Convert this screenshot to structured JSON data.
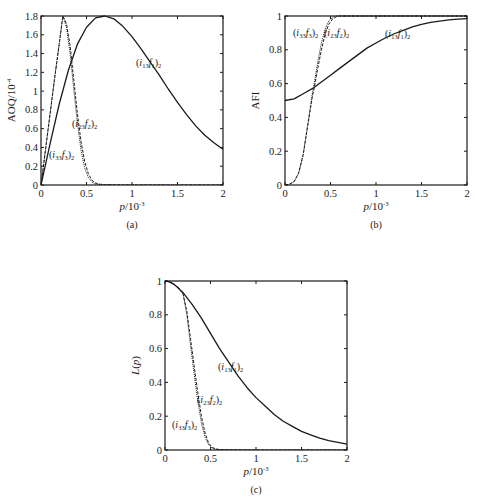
{
  "chart_data": [
    {
      "id": "a",
      "type": "line",
      "caption": "(a)",
      "xlabel": "p/10^-3",
      "xlabel_main": "p",
      "xlabel_unit": "/10",
      "xlabel_exp": "-3",
      "ylabel": "AOQ/10^-4",
      "ylabel_main": "AOQ/10",
      "ylabel_exp": "-4",
      "xlim": [
        0,
        2
      ],
      "ylim": [
        0,
        1.8
      ],
      "xticks": [
        0,
        0.5,
        1,
        1.5,
        2
      ],
      "xtick_labels": [
        "0",
        "0.5",
        "1",
        "1.5",
        "2"
      ],
      "yticks": [
        0,
        0.2,
        0.4,
        0.6,
        0.8,
        1,
        1.2,
        1.4,
        1.6,
        1.8
      ],
      "ytick_labels": [
        "0",
        "0.2",
        "0.4",
        "0.6",
        "0.8",
        "1",
        "1.2",
        "1.4",
        "1.6",
        "1.8"
      ],
      "grid": false,
      "frame": {
        "left": 41,
        "top": 16,
        "right": 223,
        "bottom": 185
      },
      "series": [
        {
          "name": "(i13f1)2",
          "style": "solid",
          "x": [
            0,
            0.05,
            0.1,
            0.2,
            0.3,
            0.4,
            0.5,
            0.6,
            0.7,
            0.8,
            0.9,
            1.0,
            1.1,
            1.2,
            1.3,
            1.4,
            1.5,
            1.6,
            1.7,
            1.8,
            1.9,
            2.0
          ],
          "y": [
            0,
            0.22,
            0.44,
            0.86,
            1.22,
            1.5,
            1.68,
            1.78,
            1.8,
            1.77,
            1.69,
            1.58,
            1.45,
            1.31,
            1.17,
            1.02,
            0.88,
            0.75,
            0.63,
            0.53,
            0.45,
            0.38
          ]
        },
        {
          "name": "(i23f2)2",
          "style": "dashed",
          "x": [
            0,
            0.05,
            0.1,
            0.15,
            0.2,
            0.24,
            0.28,
            0.32,
            0.36,
            0.4,
            0.44,
            0.48,
            0.52,
            0.56,
            0.6,
            0.65,
            0.7,
            0.8,
            1.0,
            1.5,
            2.0
          ],
          "y": [
            0,
            0.38,
            0.76,
            1.14,
            1.5,
            1.8,
            1.72,
            1.48,
            1.12,
            0.76,
            0.46,
            0.25,
            0.12,
            0.05,
            0.02,
            0.008,
            0.004,
            0.001,
            0,
            0,
            0
          ]
        },
        {
          "name": "(i33f3)2",
          "style": "dotted",
          "x": [
            0,
            0.05,
            0.1,
            0.15,
            0.2,
            0.24,
            0.28,
            0.32,
            0.36,
            0.4,
            0.44,
            0.48,
            0.52,
            0.56,
            0.6,
            0.65,
            0.7,
            0.8,
            1.0,
            1.5,
            2.0
          ],
          "y": [
            0,
            0.38,
            0.76,
            1.14,
            1.5,
            1.8,
            1.68,
            1.4,
            1.02,
            0.66,
            0.37,
            0.18,
            0.08,
            0.03,
            0.01,
            0.004,
            0.002,
            0.001,
            0,
            0,
            0
          ]
        }
      ],
      "annotations": [
        {
          "text": "(i13f1)2",
          "base": "(i",
          "sub1": "13",
          "mid": "f",
          "sub2": "1",
          "close": ")",
          "sub3": "2",
          "x": 136,
          "y": 66
        },
        {
          "text": "(i23f2)2",
          "base": "(i",
          "sub1": "23",
          "mid": "f",
          "sub2": "2",
          "close": ")",
          "sub3": "2",
          "x": 72,
          "y": 127
        },
        {
          "text": "(i33f3)2",
          "base": "(i",
          "sub1": "33",
          "mid": "f",
          "sub2": "3",
          "close": ")",
          "sub3": "2",
          "x": 49,
          "y": 158
        }
      ]
    },
    {
      "id": "b",
      "type": "line",
      "caption": "(b)",
      "xlabel": "p/10^-3",
      "xlabel_main": "p",
      "xlabel_unit": "/10",
      "xlabel_exp": "-3",
      "ylabel": "AFI",
      "ylabel_main": "AFI",
      "ylabel_exp": "",
      "xlim": [
        0,
        2
      ],
      "ylim": [
        0,
        1
      ],
      "xticks": [
        0,
        0.5,
        1,
        1.5,
        2
      ],
      "xtick_labels": [
        "0",
        "0.5",
        "1",
        "1.5",
        "2"
      ],
      "yticks": [
        0,
        0.2,
        0.4,
        0.6,
        0.8,
        1
      ],
      "ytick_labels": [
        "0",
        "0.2",
        "0.4",
        "0.6",
        "0.8",
        "1"
      ],
      "grid": false,
      "frame": {
        "left": 285,
        "top": 16,
        "right": 467,
        "bottom": 185
      },
      "series": [
        {
          "name": "(i13f1)2",
          "style": "solid",
          "x": [
            0,
            0.1,
            0.2,
            0.3,
            0.4,
            0.5,
            0.6,
            0.7,
            0.8,
            0.9,
            1.0,
            1.1,
            1.2,
            1.3,
            1.4,
            1.5,
            1.6,
            1.7,
            1.8,
            1.9,
            2.0
          ],
          "y": [
            0.5,
            0.51,
            0.54,
            0.57,
            0.61,
            0.65,
            0.69,
            0.73,
            0.77,
            0.81,
            0.84,
            0.87,
            0.895,
            0.915,
            0.935,
            0.95,
            0.962,
            0.97,
            0.977,
            0.982,
            0.985
          ]
        },
        {
          "name": "(i23f2)2",
          "style": "dashed",
          "x": [
            0,
            0.05,
            0.1,
            0.15,
            0.2,
            0.25,
            0.3,
            0.33,
            0.36,
            0.4,
            0.44,
            0.48,
            0.52,
            0.56,
            0.6,
            0.7,
            1.0,
            2.0
          ],
          "y": [
            0,
            0.005,
            0.02,
            0.07,
            0.18,
            0.35,
            0.52,
            0.6,
            0.69,
            0.8,
            0.89,
            0.95,
            0.98,
            0.995,
            1,
            1,
            1,
            1
          ]
        },
        {
          "name": "(i33f3)2",
          "style": "dotted",
          "x": [
            0,
            0.05,
            0.1,
            0.15,
            0.2,
            0.25,
            0.3,
            0.33,
            0.36,
            0.4,
            0.44,
            0.48,
            0.52,
            0.56,
            0.6,
            0.7,
            1.0,
            2.0
          ],
          "y": [
            0,
            0.005,
            0.02,
            0.07,
            0.18,
            0.36,
            0.54,
            0.63,
            0.73,
            0.84,
            0.92,
            0.97,
            0.99,
            1,
            1,
            1,
            1,
            1
          ]
        }
      ],
      "annotations": [
        {
          "text": "(i33f3)2",
          "base": "(i",
          "sub1": "33",
          "mid": "f",
          "sub2": "3",
          "close": ")",
          "sub3": "2",
          "x": 293,
          "y": 36
        },
        {
          "text": "(i23f2)2",
          "base": "(i",
          "sub1": "23",
          "mid": "f",
          "sub2": "2",
          "close": ")",
          "sub3": "2",
          "x": 324,
          "y": 36
        },
        {
          "text": "(i13f1)2",
          "base": "(i",
          "sub1": "13",
          "mid": "f",
          "sub2": "1",
          "close": ")",
          "sub3": "2",
          "x": 385,
          "y": 37
        }
      ]
    },
    {
      "id": "c",
      "type": "line",
      "caption": "(c)",
      "xlabel": "p/10^-3",
      "xlabel_main": "p",
      "xlabel_unit": "/10",
      "xlabel_exp": "-3",
      "ylabel": "L(p)",
      "ylabel_main": "L(p)",
      "ylabel_exp": "",
      "xlim": [
        0,
        2
      ],
      "ylim": [
        0,
        1
      ],
      "xticks": [
        0,
        0.5,
        1,
        1.5,
        2
      ],
      "xtick_labels": [
        "0",
        "0.5",
        "1",
        "1.5",
        "2"
      ],
      "yticks": [
        0,
        0.2,
        0.4,
        0.6,
        0.8,
        1
      ],
      "ytick_labels": [
        "0",
        "0.2",
        "0.4",
        "0.6",
        "0.8",
        "1"
      ],
      "grid": false,
      "frame": {
        "left": 165,
        "top": 281,
        "right": 347,
        "bottom": 450
      },
      "series": [
        {
          "name": "(i13f1)2",
          "style": "solid",
          "x": [
            0,
            0.05,
            0.1,
            0.2,
            0.3,
            0.4,
            0.5,
            0.6,
            0.7,
            0.8,
            0.9,
            1.0,
            1.1,
            1.2,
            1.3,
            1.4,
            1.5,
            1.6,
            1.7,
            1.8,
            1.9,
            2.0
          ],
          "y": [
            1,
            0.995,
            0.98,
            0.93,
            0.86,
            0.78,
            0.69,
            0.6,
            0.52,
            0.44,
            0.37,
            0.31,
            0.26,
            0.21,
            0.17,
            0.14,
            0.11,
            0.09,
            0.07,
            0.055,
            0.045,
            0.035
          ]
        },
        {
          "name": "(i23f2)2",
          "style": "dashed",
          "x": [
            0,
            0.05,
            0.1,
            0.15,
            0.2,
            0.24,
            0.28,
            0.32,
            0.36,
            0.4,
            0.44,
            0.48,
            0.52,
            0.56,
            0.6,
            0.7,
            1.0,
            1.5,
            2.0
          ],
          "y": [
            1,
            0.995,
            0.98,
            0.96,
            0.92,
            0.82,
            0.66,
            0.5,
            0.34,
            0.2,
            0.1,
            0.04,
            0.015,
            0.006,
            0.003,
            0.001,
            0,
            0,
            0
          ]
        },
        {
          "name": "(i33f3)2",
          "style": "dotted",
          "x": [
            0,
            0.05,
            0.1,
            0.15,
            0.2,
            0.24,
            0.28,
            0.32,
            0.36,
            0.4,
            0.44,
            0.48,
            0.52,
            0.56,
            0.6,
            0.7,
            1.0,
            1.5,
            2.0
          ],
          "y": [
            1,
            0.995,
            0.98,
            0.96,
            0.92,
            0.8,
            0.62,
            0.45,
            0.29,
            0.16,
            0.075,
            0.03,
            0.01,
            0.004,
            0.002,
            0.001,
            0,
            0,
            0
          ]
        }
      ],
      "annotations": [
        {
          "text": "(i13f1)2",
          "base": "(i",
          "sub1": "13",
          "mid": "f",
          "sub2": "1",
          "close": ")",
          "sub3": "2",
          "x": 218,
          "y": 370
        },
        {
          "text": "(i23f2)2",
          "base": "(i",
          "sub1": "23",
          "mid": "f",
          "sub2": "2",
          "close": ")",
          "sub3": "2",
          "x": 197,
          "y": 403
        },
        {
          "text": "(i33f3)2",
          "base": "(i",
          "sub1": "33",
          "mid": "f",
          "sub2": "3",
          "close": ")",
          "sub3": "2",
          "x": 172,
          "y": 428
        }
      ]
    }
  ],
  "figure": {
    "line_color": "#1a1a1a",
    "captions": [
      "(a)",
      "(b)",
      "(c)"
    ]
  }
}
